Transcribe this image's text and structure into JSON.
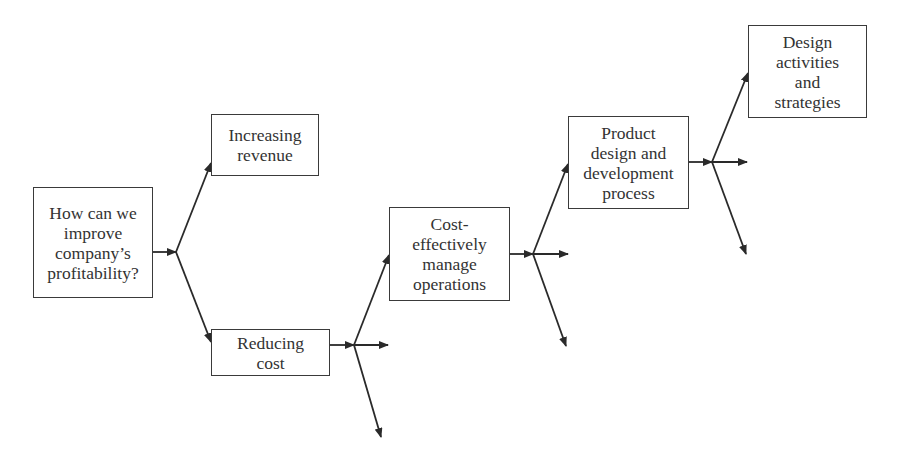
{
  "diagram": {
    "type": "logic-tree",
    "line_color": "#2a2a2a",
    "nodes": [
      {
        "id": "root",
        "label": "How can we\nimprove\ncompany’s\nprofitability?"
      },
      {
        "id": "increasing-revenue",
        "label": "Increasing\nrevenue"
      },
      {
        "id": "reducing-cost",
        "label": "Reducing\ncost"
      },
      {
        "id": "cost-effectively",
        "label": "Cost-\neffectively\nmanage\noperations"
      },
      {
        "id": "product-design",
        "label": "Product\ndesign and\ndevelopment\nprocess"
      },
      {
        "id": "design-activities",
        "label": "Design\nactivities\nand\nstrategies"
      }
    ],
    "edges": [
      {
        "from": "root",
        "to": "increasing-revenue"
      },
      {
        "from": "root",
        "to": "reducing-cost"
      },
      {
        "from": "reducing-cost",
        "to": "cost-effectively"
      },
      {
        "from": "reducing-cost",
        "to": "(unlabeled)"
      },
      {
        "from": "reducing-cost",
        "to": "(unlabeled)"
      },
      {
        "from": "cost-effectively",
        "to": "product-design"
      },
      {
        "from": "cost-effectively",
        "to": "(unlabeled)"
      },
      {
        "from": "cost-effectively",
        "to": "(unlabeled)"
      },
      {
        "from": "product-design",
        "to": "design-activities"
      },
      {
        "from": "product-design",
        "to": "(unlabeled)"
      },
      {
        "from": "product-design",
        "to": "(unlabeled)"
      }
    ]
  }
}
